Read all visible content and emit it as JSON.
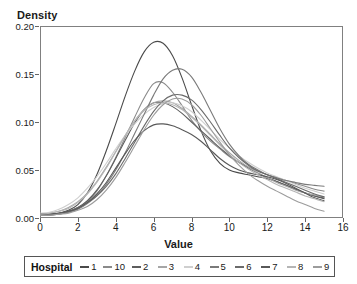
{
  "chart_data": {
    "type": "line",
    "title": "",
    "subtitle": "",
    "xlabel": "Value",
    "ylabel": "Density",
    "xlim": [
      0,
      16
    ],
    "ylim": [
      0.0,
      0.2
    ],
    "xticks": [
      "0",
      "2",
      "4",
      "6",
      "8",
      "10",
      "12",
      "14",
      "16"
    ],
    "xtick_values": [
      0,
      2,
      4,
      6,
      8,
      10,
      12,
      14,
      16
    ],
    "yticks": [
      "0.00",
      "0.05",
      "0.10",
      "0.15",
      "0.20"
    ],
    "ytick_values": [
      0.0,
      0.05,
      0.1,
      0.15,
      0.2
    ],
    "grid": false,
    "legend_position": "bottom",
    "legend_title": "Hospital",
    "x": [
      0,
      0.5,
      1,
      1.5,
      2,
      2.5,
      3,
      3.5,
      4,
      4.5,
      5,
      5.5,
      6,
      6.5,
      7,
      7.5,
      8,
      8.5,
      9,
      9.5,
      10,
      10.5,
      11,
      11.5,
      12,
      12.5,
      13,
      13.5,
      14,
      14.5,
      15
    ],
    "series": [
      {
        "name": "1",
        "color": "#4a4a4a",
        "values": [
          0.004,
          0.004,
          0.005,
          0.008,
          0.014,
          0.026,
          0.045,
          0.07,
          0.098,
          0.127,
          0.153,
          0.173,
          0.183,
          0.182,
          0.169,
          0.146,
          0.118,
          0.091,
          0.07,
          0.057,
          0.05,
          0.047,
          0.045,
          0.043,
          0.041,
          0.038,
          0.034,
          0.03,
          0.026,
          0.023,
          0.02
        ]
      },
      {
        "name": "10",
        "color": "#8a8a8a",
        "values": [
          0.003,
          0.003,
          0.004,
          0.006,
          0.01,
          0.017,
          0.028,
          0.044,
          0.063,
          0.084,
          0.105,
          0.125,
          0.14,
          0.141,
          0.131,
          0.117,
          0.102,
          0.09,
          0.08,
          0.072,
          0.064,
          0.058,
          0.053,
          0.049,
          0.045,
          0.042,
          0.039,
          0.036,
          0.033,
          0.03,
          0.028
        ]
      },
      {
        "name": "2",
        "color": "#5d5d5d",
        "values": [
          0.004,
          0.004,
          0.005,
          0.007,
          0.011,
          0.018,
          0.029,
          0.044,
          0.062,
          0.081,
          0.099,
          0.113,
          0.12,
          0.12,
          0.116,
          0.109,
          0.1,
          0.091,
          0.082,
          0.073,
          0.065,
          0.058,
          0.052,
          0.047,
          0.042,
          0.038,
          0.034,
          0.03,
          0.026,
          0.023,
          0.021
        ]
      },
      {
        "name": "3",
        "color": "#a6a6a6",
        "values": [
          0.004,
          0.005,
          0.007,
          0.011,
          0.017,
          0.026,
          0.038,
          0.053,
          0.069,
          0.086,
          0.101,
          0.113,
          0.12,
          0.122,
          0.12,
          0.114,
          0.106,
          0.097,
          0.087,
          0.077,
          0.068,
          0.06,
          0.053,
          0.047,
          0.042,
          0.037,
          0.033,
          0.029,
          0.026,
          0.024,
          0.022
        ]
      },
      {
        "name": "4",
        "color": "#cfcfcf",
        "values": [
          0.005,
          0.006,
          0.009,
          0.014,
          0.021,
          0.031,
          0.043,
          0.057,
          0.072,
          0.086,
          0.098,
          0.108,
          0.115,
          0.119,
          0.12,
          0.117,
          0.111,
          0.102,
          0.092,
          0.082,
          0.073,
          0.065,
          0.058,
          0.052,
          0.047,
          0.043,
          0.039,
          0.035,
          0.031,
          0.028,
          0.025
        ]
      },
      {
        "name": "5",
        "color": "#7a7a7a",
        "values": [
          0.003,
          0.003,
          0.004,
          0.006,
          0.009,
          0.015,
          0.023,
          0.035,
          0.05,
          0.068,
          0.088,
          0.108,
          0.128,
          0.145,
          0.154,
          0.155,
          0.147,
          0.131,
          0.112,
          0.093,
          0.077,
          0.065,
          0.056,
          0.05,
          0.045,
          0.042,
          0.039,
          0.037,
          0.035,
          0.034,
          0.033
        ]
      },
      {
        "name": "6",
        "color": "#6b6b6b",
        "values": [
          0.004,
          0.004,
          0.005,
          0.007,
          0.011,
          0.016,
          0.023,
          0.033,
          0.046,
          0.062,
          0.079,
          0.096,
          0.111,
          0.122,
          0.128,
          0.128,
          0.123,
          0.113,
          0.1,
          0.086,
          0.073,
          0.063,
          0.055,
          0.049,
          0.045,
          0.041,
          0.037,
          0.033,
          0.029,
          0.025,
          0.022
        ]
      },
      {
        "name": "7",
        "color": "#585858",
        "values": [
          0.004,
          0.004,
          0.005,
          0.007,
          0.01,
          0.016,
          0.025,
          0.037,
          0.052,
          0.067,
          0.081,
          0.091,
          0.097,
          0.098,
          0.096,
          0.092,
          0.087,
          0.08,
          0.071,
          0.062,
          0.055,
          0.05,
          0.047,
          0.045,
          0.043,
          0.04,
          0.036,
          0.031,
          0.026,
          0.021,
          0.018
        ]
      },
      {
        "name": "8",
        "color": "#b5b5b5",
        "values": [
          0.004,
          0.005,
          0.007,
          0.01,
          0.016,
          0.025,
          0.037,
          0.052,
          0.069,
          0.086,
          0.101,
          0.112,
          0.118,
          0.12,
          0.118,
          0.113,
          0.105,
          0.096,
          0.086,
          0.076,
          0.066,
          0.058,
          0.051,
          0.045,
          0.04,
          0.035,
          0.031,
          0.027,
          0.023,
          0.02,
          0.017
        ]
      },
      {
        "name": "9",
        "color": "#9c9c9c",
        "values": [
          0.003,
          0.003,
          0.004,
          0.005,
          0.008,
          0.012,
          0.019,
          0.029,
          0.042,
          0.058,
          0.075,
          0.092,
          0.107,
          0.118,
          0.124,
          0.124,
          0.118,
          0.107,
          0.093,
          0.079,
          0.066,
          0.055,
          0.046,
          0.039,
          0.033,
          0.028,
          0.023,
          0.018,
          0.014,
          0.01,
          0.007
        ]
      }
    ]
  },
  "axes": {
    "ylabel": "Density",
    "xlabel": "Value"
  },
  "legend": {
    "title": "Hospital",
    "items": [
      {
        "label": "1",
        "color": "#4a4a4a"
      },
      {
        "label": "10",
        "color": "#8a8a8a"
      },
      {
        "label": "2",
        "color": "#5d5d5d"
      },
      {
        "label": "3",
        "color": "#a6a6a6"
      },
      {
        "label": "4",
        "color": "#cfcfcf"
      },
      {
        "label": "5",
        "color": "#7a7a7a"
      },
      {
        "label": "6",
        "color": "#6b6b6b"
      },
      {
        "label": "7",
        "color": "#585858"
      },
      {
        "label": "8",
        "color": "#b5b5b5"
      },
      {
        "label": "9",
        "color": "#9c9c9c"
      }
    ]
  }
}
